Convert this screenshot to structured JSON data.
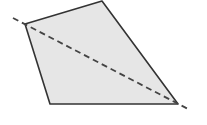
{
  "diagram": {
    "type": "quadrilateral-with-diagonal",
    "polygon": {
      "points": [
        [
          25,
          24
        ],
        [
          102,
          1
        ],
        [
          178,
          104
        ],
        [
          50,
          104
        ]
      ],
      "fill": "#e6e6e6",
      "stroke": "#333333"
    },
    "diagonal": {
      "x1": 13,
      "y1": 18,
      "x2": 190,
      "y2": 110,
      "stroke": "#444444",
      "dasharray": "6,4"
    }
  }
}
